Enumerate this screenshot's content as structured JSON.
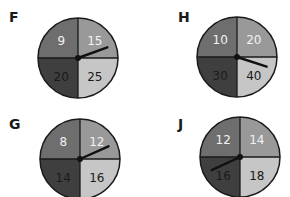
{
  "colors": {
    "top_left": "#6e6e6e",
    "top_right": "#999999",
    "bottom_left": "#3f3f3f",
    "bottom_right": "#c6c6c6",
    "outline": "#1a1a1a",
    "light_text": "#f2f2f2",
    "dark_text": "#1a1a1a"
  },
  "spinners": [
    {
      "label": "F",
      "sections": {
        "top_left": "9",
        "top_right": "15",
        "bottom_left": "20",
        "bottom_right": "25"
      },
      "pointer_toward": "top_right"
    },
    {
      "label": "H",
      "sections": {
        "top_left": "10",
        "top_right": "20",
        "bottom_left": "30",
        "bottom_right": "40"
      },
      "pointer_toward": "bottom_right"
    },
    {
      "label": "G",
      "sections": {
        "top_left": "8",
        "top_right": "12",
        "bottom_left": "14",
        "bottom_right": "16"
      },
      "pointer_toward": "top_right"
    },
    {
      "label": "J",
      "sections": {
        "top_left": "12",
        "top_right": "14",
        "bottom_left": "16",
        "bottom_right": "18"
      },
      "pointer_toward": "bottom_left"
    }
  ]
}
